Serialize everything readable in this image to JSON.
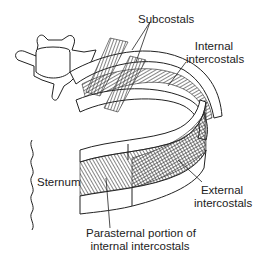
{
  "figure": {
    "labels": {
      "subcostals": "Subcostals",
      "internal_intercostals_1": "Internal",
      "internal_intercostals_2": "intercostals",
      "sternum": "Sternum",
      "external_intercostals_1": "External",
      "external_intercostals_2": "intercostals",
      "parasternal_1": "Parasternal portion of",
      "parasternal_2": "internal intercostals"
    },
    "colors": {
      "line": "#222222",
      "fill": "#ffffff",
      "hatch": "#333333"
    }
  }
}
